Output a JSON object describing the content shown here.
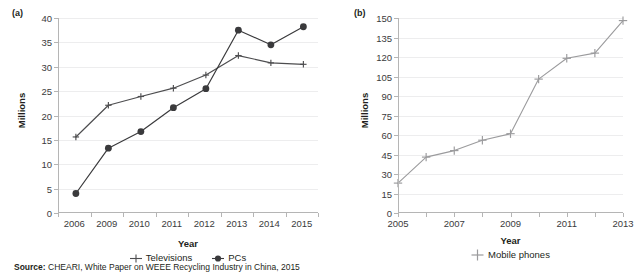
{
  "figure": {
    "source_prefix": "Source:",
    "source_text": "CHEARI, White Paper on WEEE Recycling Industry in China, 2015"
  },
  "panel_a": {
    "letter": "(a)",
    "ylabel": "Millions",
    "xlabel": "Year",
    "ytick_labels": [
      "0",
      "5",
      "10",
      "15",
      "20",
      "25",
      "30",
      "35",
      "40"
    ],
    "xtick_labels": [
      "2006",
      "2009",
      "2010",
      "2011",
      "2012",
      "2013",
      "2014",
      "2015"
    ],
    "legend": [
      {
        "label": "Televisions",
        "marker": "cross-marker",
        "color": "#4d4d4f"
      },
      {
        "label": "PCs",
        "marker": "circle-marker",
        "color": "#3a3a3c"
      }
    ]
  },
  "panel_b": {
    "letter": "(b)",
    "ylabel": "Millions",
    "xlabel": "Year",
    "ytick_labels": [
      "0",
      "15",
      "30",
      "45",
      "60",
      "75",
      "90",
      "105",
      "120",
      "135",
      "150"
    ],
    "xtick_labels": [
      "2005",
      "2007",
      "2009",
      "2011",
      "2013"
    ],
    "legend": [
      {
        "label": "Mobile phones",
        "marker": "cross-marker",
        "color": "#9b9b9d"
      }
    ]
  },
  "chart_data": [
    {
      "panel": "(a)",
      "type": "line",
      "title": "",
      "xlabel": "Year",
      "ylabel": "Millions",
      "categories": [
        "2006",
        "2009",
        "2010",
        "2011",
        "2012",
        "2013",
        "2014",
        "2015"
      ],
      "ylim": [
        0,
        40
      ],
      "ytick_step": 5,
      "grid": true,
      "legend_position": "bottom",
      "series": [
        {
          "name": "Televisions",
          "marker": "cross",
          "color": "#4d4d4f",
          "values": [
            15.6,
            22.1,
            23.9,
            25.6,
            28.3,
            32.3,
            30.8,
            30.5
          ]
        },
        {
          "name": "PCs",
          "marker": "circle",
          "color": "#3a3a3c",
          "values": [
            4.0,
            13.3,
            16.7,
            21.6,
            25.5,
            37.5,
            34.5,
            38.2
          ]
        }
      ]
    },
    {
      "panel": "(b)",
      "type": "line",
      "title": "",
      "xlabel": "Year",
      "ylabel": "Millions",
      "x": [
        2005,
        2006,
        2007,
        2008,
        2009,
        2010,
        2011,
        2012,
        2013
      ],
      "categories": [
        "2005",
        "2006",
        "2007",
        "2008",
        "2009",
        "2010",
        "2011",
        "2012",
        "2013"
      ],
      "ylim": [
        0,
        150
      ],
      "ytick_step": 15,
      "xtick_labels_shown": [
        "2005",
        "2007",
        "2009",
        "2011",
        "2013"
      ],
      "grid": true,
      "legend_position": "bottom",
      "series": [
        {
          "name": "Mobile phones",
          "marker": "cross",
          "color": "#9b9b9d",
          "values": [
            23,
            43,
            48,
            56,
            61,
            103,
            119,
            123,
            148
          ]
        }
      ]
    }
  ]
}
